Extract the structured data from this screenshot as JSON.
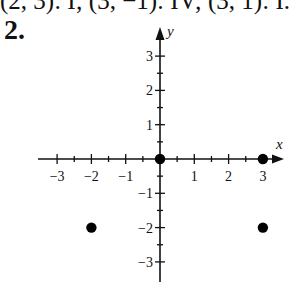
{
  "header": {
    "clipped_previous_line": "(2, 3): I; (3, −1): IV; (3, 1): I.",
    "problem_number": "2."
  },
  "graph": {
    "x_axis_label": "x",
    "y_axis_label": "y",
    "x_tick_labels": [
      "−3",
      "−2",
      "−1",
      "1",
      "2",
      "3"
    ],
    "y_tick_labels": [
      "3",
      "2",
      "1",
      "−1",
      "−2",
      "−3"
    ],
    "colors": {
      "axis": "#111111",
      "point": "#000000"
    }
  },
  "chart_data": {
    "type": "scatter",
    "title": "",
    "xlabel": "x",
    "ylabel": "y",
    "xlim": [
      -3.5,
      3.5
    ],
    "ylim": [
      -3.5,
      3.5
    ],
    "x_ticks": [
      -3,
      -2,
      -1,
      1,
      2,
      3
    ],
    "y_ticks": [
      -3,
      -2,
      -1,
      1,
      2,
      3
    ],
    "minor_ticks_step": 0.5,
    "grid": false,
    "legend": null,
    "points": [
      {
        "x": 0,
        "y": 0
      },
      {
        "x": 3,
        "y": 0
      },
      {
        "x": -2,
        "y": -2
      },
      {
        "x": 3,
        "y": -2
      }
    ]
  }
}
